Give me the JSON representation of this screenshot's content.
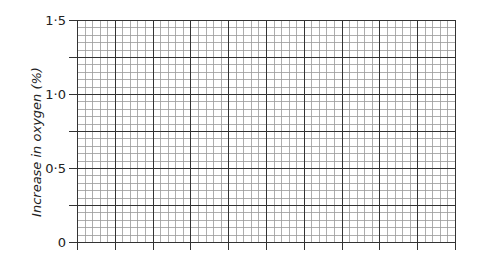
{
  "chart_data": {
    "type": "line",
    "title": "",
    "xlabel": "",
    "ylabel": "Increase in oxygen (%)",
    "ylim": [
      0,
      1.5
    ],
    "yticks": [
      {
        "value": 0,
        "label": "0"
      },
      {
        "value": 0.5,
        "label": "0·5"
      },
      {
        "value": 1.0,
        "label": "1·0"
      },
      {
        "value": 1.5,
        "label": "1·5"
      }
    ],
    "xticks": [],
    "grid": {
      "on": true,
      "major_cols": 10,
      "major_rows": 6,
      "minor_per_major": 5
    },
    "series": [],
    "note": "Blank graph paper grid with y-axis only labelled; no data plotted"
  },
  "axis": {
    "ylabel": "Increase in oxygen (%)",
    "tick_labels": [
      "1·5",
      "1·0",
      "0·5",
      "0"
    ]
  },
  "colors": {
    "major_line": "#333333",
    "minor_line": "#9a9a9a",
    "text": "#222222"
  }
}
